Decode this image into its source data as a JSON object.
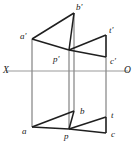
{
  "figure": {
    "kind": "descriptive-geometry-orthographic-projection",
    "background_color": "#ffffff",
    "stroke_color": "#1f1f1f",
    "axis_color": "#9a9a9a",
    "projector_color": "#8c8c8c",
    "view_box": "0 0 136 145",
    "width": 136,
    "height": 145
  },
  "axis": {
    "name": "ground-line",
    "left_label": "X",
    "right_label": "O",
    "y": 71,
    "x_start": 6,
    "x_end": 128,
    "left_label_x": 3,
    "left_label_y": 66,
    "right_label_x": 124,
    "right_label_y": 66
  },
  "labels": {
    "a_prime": "a'",
    "b_prime": "b'",
    "p_prime": "p'",
    "t_prime": "t'",
    "c_prime": "c'",
    "a": "a",
    "b": "b",
    "p": "p",
    "t": "t",
    "c": "c"
  },
  "label_positions": {
    "a_prime": {
      "x": 20,
      "y": 32
    },
    "b_prime": {
      "x": 76,
      "y": 3
    },
    "p_prime": {
      "x": 53,
      "y": 55
    },
    "t_prime": {
      "x": 109,
      "y": 26
    },
    "c_prime": {
      "x": 110,
      "y": 57
    },
    "a": {
      "x": 22,
      "y": 127
    },
    "b": {
      "x": 80,
      "y": 107
    },
    "p": {
      "x": 64,
      "y": 132
    },
    "t": {
      "x": 111,
      "y": 111
    },
    "c": {
      "x": 111,
      "y": 130
    }
  },
  "points": {
    "a_prime": {
      "x": 32,
      "y": 39
    },
    "b_prime": {
      "x": 74,
      "y": 13
    },
    "p_prime": {
      "x": 69,
      "y": 50
    },
    "t_prime": {
      "x": 106,
      "y": 35
    },
    "c_prime": {
      "x": 106,
      "y": 57
    },
    "a": {
      "x": 32,
      "y": 127
    },
    "b": {
      "x": 74,
      "y": 111
    },
    "p": {
      "x": 69,
      "y": 129
    },
    "t": {
      "x": 106,
      "y": 117
    },
    "c": {
      "x": 106,
      "y": 133
    }
  },
  "edges_top_view": [
    {
      "name": "a-prime-to-b-prime",
      "from": "a_prime",
      "to": "b_prime"
    },
    {
      "name": "a-prime-to-p-prime",
      "from": "a_prime",
      "to": "p_prime"
    },
    {
      "name": "p-prime-to-t-prime",
      "from": "p_prime",
      "to": "t_prime"
    },
    {
      "name": "p-prime-to-c-prime",
      "from": "p_prime",
      "to": "c_prime"
    },
    {
      "name": "b-prime-to-p-prime",
      "from": "b_prime",
      "to": "p_prime"
    }
  ],
  "edges_front_view": [
    {
      "name": "a-to-b",
      "from": "a",
      "to": "b"
    },
    {
      "name": "a-to-p",
      "from": "a",
      "to": "p"
    },
    {
      "name": "p-to-t",
      "from": "p",
      "to": "t"
    },
    {
      "name": "p-to-c",
      "from": "p",
      "to": "c"
    },
    {
      "name": "b-to-p",
      "from": "b",
      "to": "p"
    }
  ],
  "projectors": [
    {
      "name": "projector-a",
      "x": 32,
      "y1": 39,
      "y2": 127
    },
    {
      "name": "projector-b",
      "x": 74,
      "y1": 13,
      "y2": 111
    },
    {
      "name": "projector-p",
      "x": 69,
      "y1": 50,
      "y2": 129
    },
    {
      "name": "projector-t-c",
      "x": 106,
      "y1": 35,
      "y2": 133
    }
  ]
}
